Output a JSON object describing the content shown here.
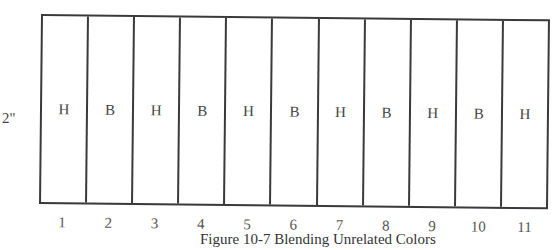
{
  "figure": {
    "caption": "Figure 10-7 Blending Unrelated Colors",
    "height_label": "2\"",
    "top_fragment": "¯",
    "cells": [
      {
        "number": "1",
        "letter": "H"
      },
      {
        "number": "2",
        "letter": "B"
      },
      {
        "number": "3",
        "letter": "H"
      },
      {
        "number": "4",
        "letter": "B"
      },
      {
        "number": "5",
        "letter": "H"
      },
      {
        "number": "6",
        "letter": "B"
      },
      {
        "number": "7",
        "letter": "H"
      },
      {
        "number": "8",
        "letter": "B"
      },
      {
        "number": "9",
        "letter": "H"
      },
      {
        "number": "10",
        "letter": "B"
      },
      {
        "number": "11",
        "letter": "H"
      }
    ],
    "line_color": "#3a3a3a"
  }
}
